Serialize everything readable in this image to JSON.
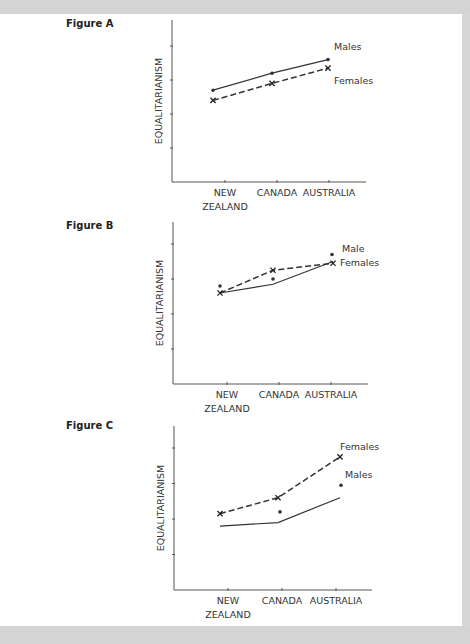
{
  "chart_data": [
    {
      "type": "line",
      "title": "Figure A",
      "xlabel": "",
      "ylabel": "EQUALITARIANISM",
      "categories": [
        "NEW ZEALAND",
        "CANADA",
        "AUSTRALIA"
      ],
      "category_lines": [
        [
          "NEW",
          "ZEALAND"
        ],
        [
          "CANADA"
        ],
        [
          "AUSTRALIA"
        ]
      ],
      "ylim": [
        0,
        4.6
      ],
      "yticks": [
        1,
        2,
        3,
        4
      ],
      "ytick_labels": [
        "",
        "",
        "",
        ""
      ],
      "grid": false,
      "series": [
        {
          "name": "Males",
          "label": "Males",
          "style": "solid",
          "marker": "dot",
          "values": [
            2.7,
            3.2,
            3.6
          ]
        },
        {
          "name": "Females",
          "label": "Females",
          "style": "dashed",
          "marker": "x",
          "values": [
            2.4,
            2.9,
            3.35
          ]
        }
      ],
      "extra_points": []
    },
    {
      "type": "line",
      "title": "Figure B",
      "xlabel": "",
      "ylabel": "EQUALITARIANISM",
      "categories": [
        "NEW ZEALAND",
        "CANADA",
        "AUSTRALIA"
      ],
      "category_lines": [
        [
          "NEW",
          "ZEALAND"
        ],
        [
          "CANADA"
        ],
        [
          "AUSTRALIA"
        ]
      ],
      "ylim": [
        0,
        4.6
      ],
      "yticks": [
        1,
        2,
        3,
        4
      ],
      "ytick_labels": [
        "",
        "",
        "",
        ""
      ],
      "grid": false,
      "series": [
        {
          "name": "Males (line)",
          "label": "",
          "style": "solid",
          "marker": "none",
          "values": [
            2.6,
            2.85,
            3.5
          ]
        },
        {
          "name": "Females",
          "label": "Females",
          "style": "dashed",
          "marker": "x",
          "values": [
            2.6,
            3.25,
            3.45
          ]
        }
      ],
      "extra_points": [
        {
          "name": "Male",
          "label": "Male",
          "marker": "dot",
          "values": [
            2.8,
            3.0,
            3.7
          ]
        }
      ]
    },
    {
      "type": "line",
      "title": "Figure C",
      "xlabel": "",
      "ylabel": "EQUALITARIANISM",
      "categories": [
        "NEW ZEALAND",
        "CANADA",
        "AUSTRALIA"
      ],
      "category_lines": [
        [
          "NEW",
          "ZEALAND"
        ],
        [
          "CANADA"
        ],
        [
          "AUSTRALIA"
        ]
      ],
      "ylim": [
        0,
        4.6
      ],
      "yticks": [
        1,
        2,
        3,
        4
      ],
      "ytick_labels": [
        "",
        "",
        "",
        ""
      ],
      "grid": false,
      "series": [
        {
          "name": "Males (line)",
          "label": "",
          "style": "solid",
          "marker": "none",
          "values": [
            1.8,
            1.9,
            2.6
          ]
        },
        {
          "name": "Females",
          "label": "Females",
          "style": "dashed",
          "marker": "x",
          "values": [
            2.15,
            2.6,
            3.75
          ]
        }
      ],
      "extra_points": [
        {
          "name": "Males",
          "label": "Males",
          "marker": "dot",
          "values": [
            null,
            2.2,
            2.95
          ]
        }
      ]
    }
  ]
}
